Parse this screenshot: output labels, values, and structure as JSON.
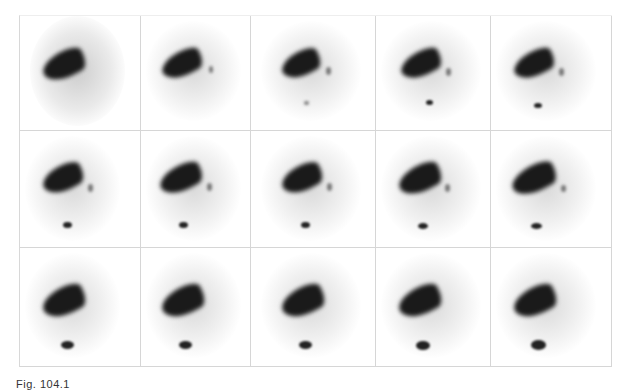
{
  "figure": {
    "caption": "Fig. 104.1",
    "rows": 3,
    "columns": 5,
    "frames": [
      {
        "row": 1,
        "col": 1,
        "gallbladder": false,
        "bowel": false,
        "diffuse": true
      },
      {
        "row": 1,
        "col": 2,
        "gallbladder": false,
        "bowel": false,
        "diffuse": false
      },
      {
        "row": 1,
        "col": 3,
        "gallbladder": true,
        "bowel": "faint",
        "diffuse": false
      },
      {
        "row": 1,
        "col": 4,
        "gallbladder": true,
        "bowel": "small",
        "diffuse": false
      },
      {
        "row": 1,
        "col": 5,
        "gallbladder": true,
        "bowel": "small",
        "diffuse": false
      },
      {
        "row": 2,
        "col": 1,
        "gallbladder": true,
        "bowel": "small",
        "diffuse": false
      },
      {
        "row": 2,
        "col": 2,
        "gallbladder": true,
        "bowel": "small",
        "diffuse": false
      },
      {
        "row": 2,
        "col": 3,
        "gallbladder": true,
        "bowel": "small",
        "diffuse": false
      },
      {
        "row": 2,
        "col": 4,
        "gallbladder": true,
        "bowel": "small",
        "diffuse": false
      },
      {
        "row": 2,
        "col": 5,
        "gallbladder": true,
        "bowel": "small",
        "diffuse": false
      },
      {
        "row": 3,
        "col": 1,
        "gallbladder": false,
        "bowel": "large",
        "diffuse": false
      },
      {
        "row": 3,
        "col": 2,
        "gallbladder": false,
        "bowel": "large",
        "diffuse": false
      },
      {
        "row": 3,
        "col": 3,
        "gallbladder": false,
        "bowel": "large",
        "diffuse": false
      },
      {
        "row": 3,
        "col": 4,
        "gallbladder": false,
        "bowel": "large",
        "diffuse": false
      },
      {
        "row": 3,
        "col": 5,
        "gallbladder": false,
        "bowel": "large",
        "diffuse": false
      }
    ]
  }
}
